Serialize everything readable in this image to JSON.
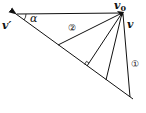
{
  "diagram": {
    "type": "velocity-vector-triangle",
    "labels": {
      "v_prime": "v′",
      "alpha": "α",
      "v0": "v",
      "v0_sub": "0",
      "v": "v",
      "line1": "①",
      "line2": "②"
    },
    "points": {
      "apex_v0": [
        122,
        13
      ],
      "v_prime_tip": [
        16,
        14
      ],
      "diagonal_end": [
        133,
        99
      ],
      "line2_foot": [
        58,
        45
      ],
      "perp_foot": [
        87,
        66
      ],
      "line3_foot": [
        106,
        80
      ],
      "line1_foot": [
        130,
        97
      ]
    },
    "colors": {
      "stroke": "#111111",
      "background": "#ffffff"
    }
  }
}
